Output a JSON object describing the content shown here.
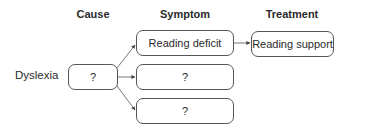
{
  "headers": {
    "cause": "Cause",
    "symptom": "Symptom",
    "treatment": "Treatment"
  },
  "input_label": "Dyslexia",
  "cause_box": {
    "text": "?"
  },
  "symptoms": [
    {
      "text": "Reading deficit"
    },
    {
      "text": "?"
    },
    {
      "text": "?"
    }
  ],
  "treatments": [
    {
      "text": "Reading support"
    }
  ],
  "colors": {
    "stroke": "#555555",
    "text": "#2a2a2a",
    "background": "#ffffff"
  }
}
